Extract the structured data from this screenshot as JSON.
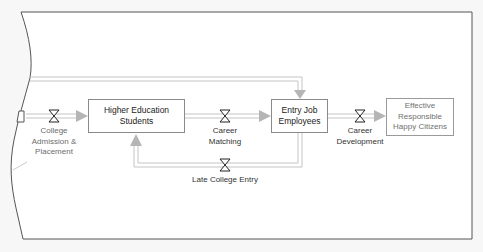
{
  "diagram": {
    "type": "stock-and-flow",
    "colors": {
      "background": "#f7f7f7",
      "canvas": "#ffffff",
      "border": "#555555",
      "stock_border": "#8a8a8a",
      "pipe": "#c4c4c4",
      "arrowhead": "#b5b5b5",
      "valve": "#222222"
    },
    "stocks": [
      {
        "id": "higher-education-students",
        "label_lines": [
          "Higher Education",
          "Students"
        ]
      },
      {
        "id": "entry-job-employees",
        "label_lines": [
          "Entry Job",
          "Employees"
        ]
      },
      {
        "id": "effective-responsible-happy-citizens",
        "label_lines": [
          "Effective",
          "Responsible",
          "Happy Citizens"
        ]
      }
    ],
    "flows": [
      {
        "id": "college-admission-placement",
        "label_lines": [
          "College",
          "Admission &",
          "Placement"
        ],
        "icon": "valve-icon"
      },
      {
        "id": "career-matching",
        "label_lines": [
          "Career",
          "Matching"
        ],
        "icon": "valve-icon"
      },
      {
        "id": "career-development",
        "label_lines": [
          "Career",
          "Development"
        ],
        "icon": "valve-icon"
      },
      {
        "id": "late-college-entry",
        "label_lines": [
          "Late College Entry"
        ],
        "icon": "valve-icon"
      }
    ],
    "connections": [
      {
        "from": "left-boundary",
        "to": "higher-education-students",
        "via": "college-admission-placement"
      },
      {
        "from": "higher-education-students",
        "to": "entry-job-employees",
        "via": "career-matching"
      },
      {
        "from": "entry-job-employees",
        "to": "effective-responsible-happy-citizens",
        "via": "career-development"
      },
      {
        "from": "entry-job-employees",
        "to": "higher-education-students",
        "via": "late-college-entry"
      },
      {
        "from": "left-boundary",
        "to": "entry-job-employees",
        "via": "top-direct-pipe"
      }
    ]
  }
}
